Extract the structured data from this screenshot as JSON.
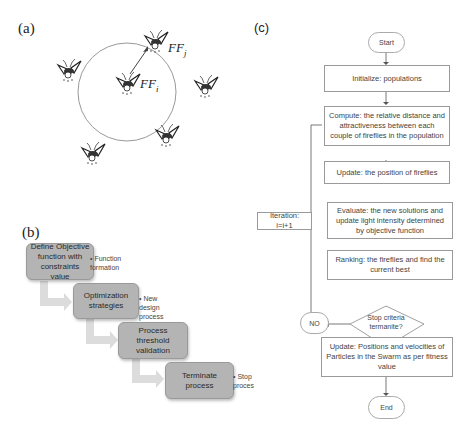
{
  "panel_a": {
    "label": "(a)",
    "firefly_i": "FF",
    "firefly_i_sub": "i",
    "firefly_j": "FF",
    "firefly_j_sub": "j",
    "icons": [
      "firefly-icon"
    ]
  },
  "panel_b": {
    "label": "(b)",
    "steps": [
      {
        "box": "Define Objective function with constraints value",
        "note": "• Function formation"
      },
      {
        "box": "Optimization strategies",
        "note": "• New design process"
      },
      {
        "box": "Process threshold validation",
        "note": ""
      },
      {
        "box": "Terminate process",
        "note": "• Stop proces"
      }
    ],
    "box_color": "#b4b4b4",
    "arrow_color": "#d8d8d8"
  },
  "panel_c": {
    "label": "(c)",
    "start": "Start",
    "initialize": "Initialize: populations",
    "compute": "Compute: the relative distance and attractiveness between each couple of fireflies in the population",
    "update_position": "Update: the position of fireflies",
    "evaluate": "Evaluate: the new solutions and update light intensity determined by objective function",
    "ranking": "Ranking: the fireflies and  find the current best",
    "decision": "Stop criteria termanite?",
    "no": "NO",
    "iteration": "Iteration: i=i+1",
    "update_particles": "Update: Positions and velocities of Particles in the Swarm as per fitness value",
    "end": "End"
  }
}
